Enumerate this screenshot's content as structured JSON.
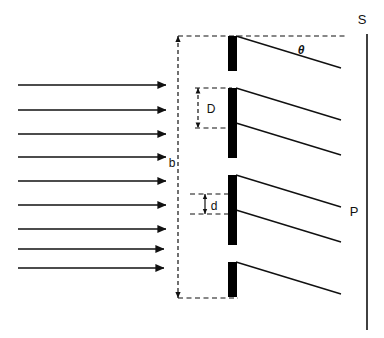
{
  "figure": {
    "background_color": "#ffffff",
    "stroke_color": "#111111",
    "bar_color": "#000000",
    "width": 384,
    "height": 338
  },
  "labels": {
    "slit_separation": "D",
    "slit_width": "d",
    "grating_height": "b",
    "angle": "θ",
    "source_label": "S",
    "screen_label": "P"
  },
  "incident_beam": {
    "name": "incident-plane-wave",
    "arrow_count": 9,
    "x_start": 18,
    "x_tip": 172,
    "y_positions": [
      85,
      110,
      134,
      157,
      181,
      205,
      229,
      249,
      268
    ]
  },
  "grating": {
    "name": "diffraction-grating",
    "bar_x": 228,
    "bar_width": 9,
    "bar_height": 35,
    "bar_tops": [
      36,
      88,
      123,
      175,
      210,
      262
    ]
  },
  "diffracted_rays": {
    "name": "diffracted-rays",
    "angle_degrees": 17,
    "length": 120,
    "origins_y": [
      36,
      88,
      123,
      175,
      210,
      262
    ]
  },
  "dimension_lines": {
    "b": {
      "x": 178,
      "y_top": 36,
      "y_bottom": 298,
      "label_x": 176,
      "label_y": 163
    },
    "b_top_dash_x_end": 345,
    "b_bottom_dash_x_end": 238,
    "D": {
      "x": 198,
      "y_top": 88,
      "y_bottom": 128,
      "label_x": 207,
      "label_y": 112,
      "dash_x_end": 232
    },
    "d": {
      "x": 205,
      "y_top": 194,
      "y_bottom": 214,
      "label_x": 212,
      "label_y": 210,
      "dash_x_start": 190,
      "dash_x_end": 232
    }
  },
  "screen": {
    "name": "observation-screen",
    "x": 367,
    "y_top": 34,
    "y_bottom": 330,
    "s_label_x": 362,
    "s_label_y": 22,
    "p_label_x": 353,
    "p_label_y": 215
  }
}
